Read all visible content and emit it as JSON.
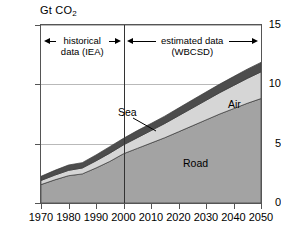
{
  "chart_data": {
    "type": "area",
    "title": "Gt CO2",
    "title_main": "Gt CO",
    "title_sub": "2",
    "xlabel": "",
    "ylabel": "Gt CO2",
    "xlim": [
      1970,
      2050
    ],
    "ylim": [
      0,
      15
    ],
    "grid": true,
    "stacked": true,
    "legend_position": "inline-annotations",
    "x": [
      1970,
      1975,
      1980,
      1985,
      1990,
      1995,
      2000,
      2005,
      2010,
      2015,
      2020,
      2025,
      2030,
      2035,
      2040,
      2045,
      2050
    ],
    "series": [
      {
        "name": "Road",
        "color": "#a3a3a3",
        "values": [
          1.55,
          1.95,
          2.3,
          2.45,
          2.95,
          3.5,
          4.15,
          4.6,
          5.05,
          5.5,
          6.0,
          6.5,
          7.0,
          7.5,
          7.95,
          8.4,
          8.8
        ]
      },
      {
        "name": "Air",
        "color": "#d6d6d6",
        "values": [
          0.35,
          0.4,
          0.45,
          0.5,
          0.6,
          0.7,
          0.75,
          0.9,
          1.05,
          1.2,
          1.35,
          1.5,
          1.65,
          1.8,
          1.95,
          2.1,
          2.25
        ]
      },
      {
        "name": "Sea",
        "color": "#4d4d4d",
        "values": [
          0.35,
          0.4,
          0.45,
          0.45,
          0.5,
          0.55,
          0.55,
          0.6,
          0.6,
          0.62,
          0.65,
          0.68,
          0.7,
          0.72,
          0.75,
          0.78,
          0.8
        ]
      }
    ],
    "ytick_labels": [
      "0",
      "5",
      "10",
      "15"
    ],
    "ytick_values": [
      0,
      5,
      10,
      15
    ],
    "xtick_labels": [
      "1970",
      "1980",
      "1990",
      "2000",
      "2010",
      "2020",
      "2030",
      "2040",
      "2050"
    ],
    "xtick_values": [
      1970,
      1980,
      1990,
      2000,
      2010,
      2020,
      2030,
      2040,
      2050
    ],
    "annotations": [
      {
        "name": "historical-period",
        "text": "historical\ndata (IEA)",
        "line1": "historical",
        "line2": "data (IEA)",
        "from": 1970,
        "to": 2000
      },
      {
        "name": "estimated-period",
        "text": "estimated data\n(WBCSD)",
        "line1": "estimated data",
        "line2": "(WBCSD)",
        "from": 2000,
        "to": 2050
      }
    ],
    "divider_x": 2000,
    "series_labels": [
      {
        "name": "Sea",
        "label": "Sea"
      },
      {
        "name": "Air",
        "label": "Air"
      },
      {
        "name": "Road",
        "label": "Road"
      }
    ]
  },
  "colors": {
    "road": "#a3a3a3",
    "air": "#d6d6d6",
    "sea": "#4d4d4d",
    "frame": "#555555",
    "grid": "#b9b9b9",
    "background": "#ffffff"
  }
}
